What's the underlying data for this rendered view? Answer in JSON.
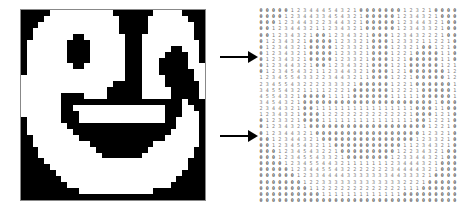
{
  "figure": {
    "left_panel": "binary-image",
    "right_panel": "distance-matrix",
    "arrows": [
      {
        "name": "arrow-top",
        "from": "binary-image",
        "to": "distance-matrix",
        "y": 56
      },
      {
        "name": "arrow-bottom",
        "from": "binary-image",
        "to": "distance-matrix",
        "y": 135
      }
    ]
  },
  "binary_image": {
    "rows": 32,
    "cols": 32,
    "on_color": "#000000",
    "off_color": "#ffffff",
    "grid": [
      "#####...........#######.....####",
      "####.............#####.......###",
      "###..............#####........##",
      "##...............#####........##",
      "##.......##.......###.........##",
      "#.......####......###..........#",
      "#.......####......###.....##...#",
      "#.......####......###....####..#",
      "#.......####......###...#####..#",
      "#........##.......###...#####...",
      "#.................###...######..",
      "..................###....#####..",
      "................#####....######.",
      "...............######.....#####.",
      ".......####....######.....#####.",
      ".......#####################.###",
      ".......##................###..##",
      ".......###...............###...#",
      "#......###...............##....#",
      "#.......###################....#",
      "#........#################.....#",
      "##........###############......#",
      "##..........###########........#",
      "###..........#########........##",
      "###...........#######.........##",
      "####.........................###",
      "#####........................###",
      "######......................####",
      "#######....................#####",
      "########..................######",
      "##########.............#########",
      "################################"
    ]
  }
}
